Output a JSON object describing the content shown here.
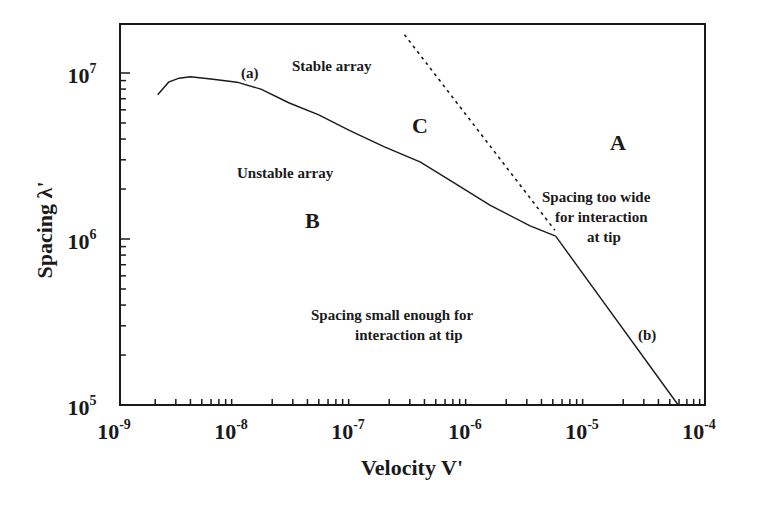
{
  "chart_data": {
    "type": "line",
    "title": "",
    "xlabel": "Velocity V'",
    "ylabel": "Spacing λ'",
    "xscale": "log",
    "yscale": "log",
    "xlim": [
      1e-09,
      0.0001
    ],
    "ylim": [
      100000.0,
      20000000.0
    ],
    "grid": false,
    "legend": "none",
    "x_ticks": [
      {
        "exp": "-9",
        "value": 1e-09
      },
      {
        "exp": "-8",
        "value": 1e-08
      },
      {
        "exp": "-7",
        "value": 1e-07
      },
      {
        "exp": "-6",
        "value": 1e-06
      },
      {
        "exp": "-5",
        "value": 1e-05
      },
      {
        "exp": "-4",
        "value": 0.0001
      }
    ],
    "y_ticks": [
      {
        "exp": "5",
        "value": 100000.0
      },
      {
        "exp": "6",
        "value": 1000000.0
      },
      {
        "exp": "7",
        "value": 10000000.0
      }
    ],
    "series": [
      {
        "name": "(a)",
        "style": "solid",
        "x": [
          2.1e-09,
          2.6e-09,
          3.2e-09,
          4e-09,
          6e-09,
          1e-08,
          1.6e-08,
          2.8e-08,
          5e-08,
          9.2e-08,
          1.8e-07,
          3.7e-07,
          7e-07,
          1.45e-06,
          3.2e-06,
          5.3e-06
        ],
        "y": [
          7400000.0,
          8800000.0,
          9300000.0,
          9500000.0,
          9200000.0,
          8800000.0,
          8000000.0,
          6600000.0,
          5600000.0,
          4500000.0,
          3600000.0,
          2900000.0,
          2200000.0,
          1600000.0,
          1200000.0,
          1040000.0
        ]
      },
      {
        "name": "(b)",
        "style": "solid",
        "x": [
          5.3e-06,
          5.9e-05
        ],
        "y": [
          1040000.0,
          100000.0
        ]
      },
      {
        "name": "stability boundary",
        "style": "dashed",
        "x": [
          2.7e-07,
          5.2e-06
        ],
        "y": [
          17000000.0,
          1130000.0
        ]
      }
    ],
    "annotations": [
      {
        "text": "(a)",
        "x": 1.1e-08,
        "y": 11000000.0
      },
      {
        "text": "(b)",
        "x": 3.3e-05,
        "y": 200000.0
      },
      {
        "text": "Stable array",
        "x": 1.2e-07,
        "y": 13000000.0
      },
      {
        "text": "C",
        "x": 4.5e-07,
        "y": 5000000.0
      },
      {
        "text": "A",
        "x": 1.6e-05,
        "y": 3800000.0
      },
      {
        "text": "Unstable array",
        "x": 4e-08,
        "y": 2700000.0
      },
      {
        "text": "B",
        "x": 4e-08,
        "y": 1200000.0
      },
      {
        "text": "Spacing too wide for interaction at tip",
        "x": 1.6e-05,
        "y": 1300000.0
      },
      {
        "text": "Spacing small enough for interaction at tip",
        "x": 1e-06,
        "y": 320000.0
      }
    ]
  },
  "labels": {
    "xlabel": "Velocity V'",
    "ylabel": "Spacing λ'",
    "curve_a": "(a)",
    "curve_b": "(b)",
    "stable": "Stable array",
    "unstable": "Unstable array",
    "region_a": "A",
    "region_b": "B",
    "region_c": "C",
    "too_wide_1": "Spacing too wide",
    "too_wide_2": "for interaction",
    "too_wide_3": "at tip",
    "small_1": "Spacing small enough for",
    "small_2": "interaction at tip",
    "tick_base": "10"
  }
}
